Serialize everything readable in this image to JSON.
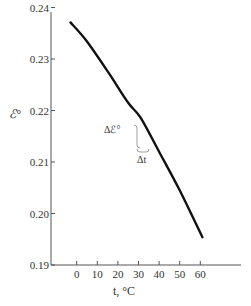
{
  "chart_data": {
    "type": "line",
    "title": "",
    "xlabel": "t, °C",
    "ylabel": "ℰ°",
    "xlim": [
      -12,
      80
    ],
    "ylim": [
      0.19,
      0.24
    ],
    "x_ticks": [
      0,
      10,
      20,
      30,
      40,
      50,
      60
    ],
    "x_tick_labels": [
      "0",
      "10",
      "20",
      "30",
      "40",
      "50",
      "60"
    ],
    "y_ticks": [
      0.19,
      0.2,
      0.21,
      0.22,
      0.23,
      0.24
    ],
    "y_tick_labels": [
      "0.19",
      "0.20",
      "0.21",
      "0.22",
      "0.23",
      "0.24"
    ],
    "grid": false,
    "legend": null,
    "series": [
      {
        "name": "ℰ° vs t",
        "x": [
          -3,
          5,
          16,
          25,
          31,
          40,
          50,
          61
        ],
        "y": [
          0.2371,
          0.2334,
          0.227,
          0.2215,
          0.2186,
          0.212,
          0.2045,
          0.1954
        ]
      }
    ],
    "annotations": [
      {
        "text": "Δℰ°",
        "near_x": 25,
        "near_y": 0.2205
      },
      {
        "text": "Δt",
        "near_x": 32,
        "near_y": 0.2165
      }
    ]
  },
  "labels": {
    "xlabel": "t, °C",
    "ylabel": "ℰ°",
    "delta_e": "Δℰ°",
    "delta_t": "Δt"
  }
}
